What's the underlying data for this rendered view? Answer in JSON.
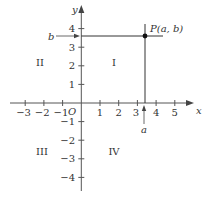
{
  "diagram": {
    "colors": {
      "axis": "#555555",
      "line": "#333333",
      "point": "#111111",
      "text": "#333333"
    },
    "axes": {
      "x_label": "x",
      "y_label": "y",
      "origin_label": "O",
      "x_ticks": [
        {
          "value": -3,
          "label": "−3"
        },
        {
          "value": -2,
          "label": "−2"
        },
        {
          "value": -1,
          "label": "−1"
        },
        {
          "value": 1,
          "label": "1"
        },
        {
          "value": 2,
          "label": "2"
        },
        {
          "value": 3,
          "label": "3"
        },
        {
          "value": 4,
          "label": "4"
        },
        {
          "value": 5,
          "label": "5"
        }
      ],
      "y_ticks": [
        {
          "value": 4,
          "label": "4"
        },
        {
          "value": 3,
          "label": "3"
        },
        {
          "value": 2,
          "label": "2"
        },
        {
          "value": 1,
          "label": "1"
        },
        {
          "value": -1,
          "label": "−1"
        },
        {
          "value": -2,
          "label": "−2"
        },
        {
          "value": -3,
          "label": "−3"
        },
        {
          "value": -4,
          "label": "−4"
        }
      ]
    },
    "quadrants": [
      {
        "id": "I",
        "label": "I"
      },
      {
        "id": "II",
        "label": "II"
      },
      {
        "id": "III",
        "label": "III"
      },
      {
        "id": "IV",
        "label": "IV"
      }
    ],
    "point": {
      "label": "P(a, b)",
      "a_value": 3.4,
      "b_value": 3.6
    },
    "markers": {
      "a_label": "a",
      "b_label": "b"
    }
  }
}
